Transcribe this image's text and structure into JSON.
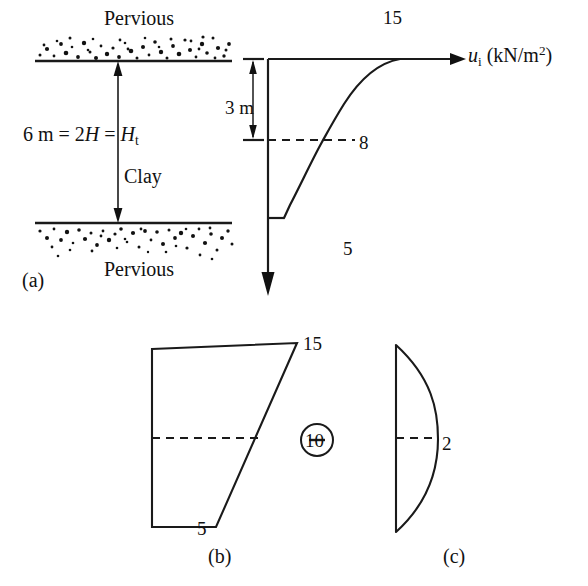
{
  "figure": {
    "title_a": "(a)",
    "title_b": "(b)",
    "title_c": "(c)",
    "panel_a": {
      "top_boundary_label": "Pervious",
      "bottom_boundary_label": "Pervious",
      "soil_label": "Clay",
      "thickness_label_html": "6 m = 2<i>H</i> = <i>H</i><sub>t</sub>",
      "depth_dimension_label": "3 m",
      "axis_label_html": "<i>u</i><sub>i</sub> (kN/m<sup>2</sup>)",
      "pressure_top_value": "15",
      "pressure_mid_value": "8",
      "pressure_bottom_value": "5"
    },
    "panel_b": {
      "top_value": "10",
      "top_label": "15",
      "mid_value": "10",
      "bottom_value": "5"
    },
    "operator": "minus-in-circle",
    "panel_c": {
      "mid_value": "2"
    },
    "colors": {
      "line": "#1a1a1a",
      "background": "#ffffff",
      "text": "#111111"
    }
  },
  "chart_data": {
    "type": "line",
    "xlabel": "u_i (kN/m^2)",
    "ylabel": "Depth (m)",
    "xlim": [
      0,
      15
    ],
    "ylim": [
      0,
      6
    ],
    "grid": false,
    "legend": "none",
    "annotations": [
      "Pervious",
      "Clay",
      "Pervious",
      "6 m = 2H = H_t",
      "3 m"
    ],
    "series": [
      {
        "name": "(a) initial excess pore water pressure u_i",
        "panel": "a",
        "x": [
          15,
          12.4,
          10.4,
          8.9,
          8.0,
          7.0,
          6.2,
          5.5,
          5.0,
          5.0
        ],
        "y": [
          0,
          0.6,
          1.2,
          1.9,
          3.0,
          3.6,
          4.2,
          4.7,
          5.1,
          5.1
        ],
        "labels": [
          {
            "text": "15",
            "x": 15,
            "y": 0
          },
          {
            "text": "8",
            "x": 8,
            "y": 3
          },
          {
            "text": "5",
            "x": 5,
            "y": 5.1
          }
        ]
      },
      {
        "name": "(b) linear trapezoidal distribution",
        "panel": "b",
        "x": [
          15,
          10,
          5
        ],
        "y": [
          0,
          3,
          6
        ],
        "labels": [
          {
            "text": "15",
            "x": 15,
            "y": 0
          },
          {
            "text": "10",
            "x": 10,
            "y": 3
          },
          {
            "text": "5",
            "x": 5,
            "y": 6
          }
        ]
      },
      {
        "name": "(c) parabolic correction distribution",
        "panel": "c",
        "x": [
          0,
          1.33,
          2.0,
          1.33,
          0
        ],
        "y": [
          0,
          1.5,
          3,
          4.5,
          6
        ],
        "labels": [
          {
            "text": "2",
            "x": 2,
            "y": 3
          }
        ]
      }
    ],
    "operator_between_b_and_c": "minus"
  }
}
